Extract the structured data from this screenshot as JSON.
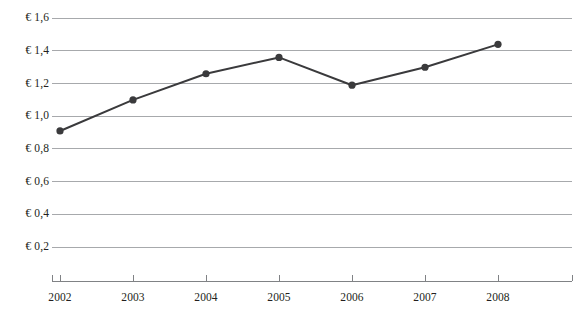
{
  "chart_data": {
    "type": "line",
    "title": "",
    "subtitle": "",
    "xlabel": "",
    "ylabel": "",
    "categories": [
      "2002",
      "2003",
      "2004",
      "2005",
      "2006",
      "2007",
      "2008"
    ],
    "x": [
      2002,
      2003,
      2004,
      2005,
      2006,
      2007,
      2008
    ],
    "values": [
      0.91,
      1.1,
      1.26,
      1.36,
      1.19,
      1.3,
      1.44
    ],
    "series": [
      {
        "name": "",
        "values": [
          0.91,
          1.1,
          1.26,
          1.36,
          1.19,
          1.3,
          1.44
        ]
      }
    ],
    "ylim": [
      0.0,
      1.7
    ],
    "xlim": [
      2001.5,
      2008.5
    ],
    "ytick_values": [
      1.6,
      1.4,
      1.2,
      1.0,
      0.8,
      0.6,
      0.4,
      0.2
    ],
    "ytick_labels": [
      "€ 1,6",
      "€ 1,4",
      "€ 1,2",
      "€ 1,0",
      "€ 0,8",
      "€ 0,6",
      "€ 0,4",
      "€ 0,2"
    ],
    "xtick_labels": [
      "2002",
      "2003",
      "2004",
      "2005",
      "2006",
      "2007",
      "2008"
    ],
    "grid": true,
    "grid_axis": "y",
    "legend": false,
    "legend_position": "none",
    "marker": "circle",
    "annotations": []
  },
  "style": {
    "line_color": "#3a3a3c",
    "marker_color": "#3a3a3c",
    "grid_color": "#a7a9ac",
    "axis_color": "#808285",
    "text_color": "#231f20",
    "background": "#ffffff"
  }
}
